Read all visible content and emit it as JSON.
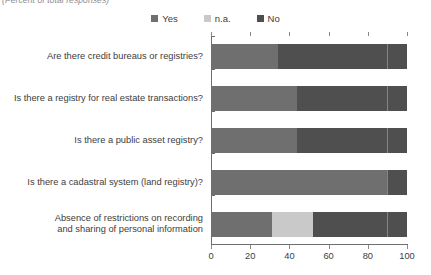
{
  "subtitle": "(Percent of total responses)",
  "legend": {
    "items": [
      {
        "label": "Yes",
        "color": "#6f6f6f"
      },
      {
        "label": "n.a.",
        "color": "#c9c9c9"
      },
      {
        "label": "No",
        "color": "#4f4f4f"
      }
    ]
  },
  "axis": {
    "x_ticks": [
      "0",
      "20",
      "40",
      "60",
      "80",
      "100"
    ],
    "x_min": 0,
    "x_max": 100
  },
  "chart_data": {
    "type": "bar",
    "orientation": "horizontal",
    "stacked": true,
    "title": "",
    "subtitle": "(Percent of total responses)",
    "xlabel": "",
    "ylabel": "",
    "xlim": [
      0,
      100
    ],
    "xticks": [
      0,
      20,
      40,
      60,
      80,
      100
    ],
    "grid": false,
    "legend_position": "top-center",
    "categories": [
      "Are there credit bureaus or registries?",
      "Is there a registry for real estate transactions?",
      "Is there a public asset registry?",
      "Is there a cadastral system (land registry)?",
      "Absence of restrictions on recording and sharing of personal information"
    ],
    "series": [
      {
        "name": "Yes",
        "color": "#6f6f6f",
        "values": [
          34,
          44,
          44,
          90,
          31
        ]
      },
      {
        "name": "n.a.",
        "color": "#c9c9c9",
        "values": [
          0,
          0,
          0,
          0,
          21
        ]
      },
      {
        "name": "No",
        "color": "#4f4f4f",
        "values": [
          66,
          56,
          56,
          10,
          48
        ]
      }
    ]
  },
  "categories_display": [
    {
      "line1": "Are there credit bureaus or registries?",
      "line2": ""
    },
    {
      "line1": "Is there a registry for real estate transactions?",
      "line2": ""
    },
    {
      "line1": "Is there a public asset registry?",
      "line2": ""
    },
    {
      "line1": "Is there a cadastral system (land registry)?",
      "line2": ""
    },
    {
      "line1": "Absence of restrictions on recording",
      "line2": "and sharing of personal information"
    }
  ]
}
